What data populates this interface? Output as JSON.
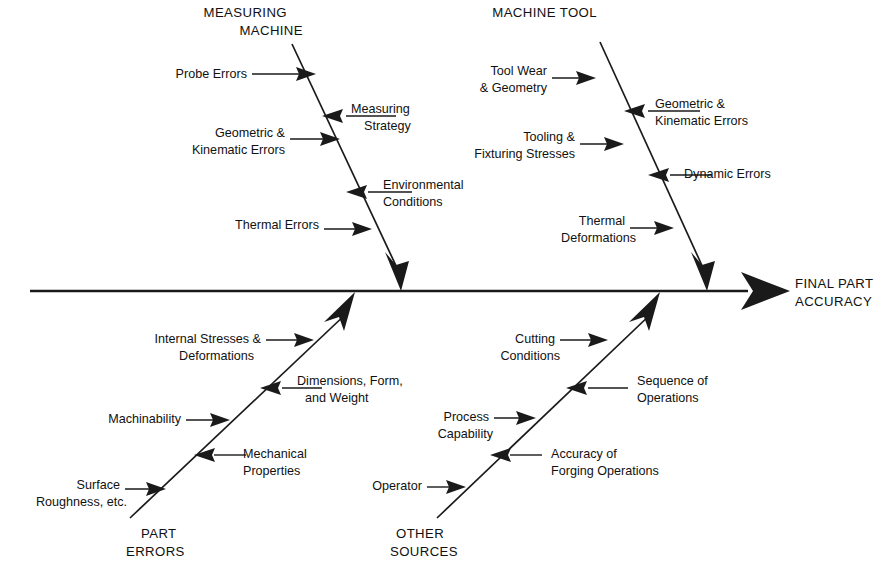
{
  "diagram": {
    "type": "fishbone-ishikawa-cause-and-effect",
    "effect": {
      "line1": "FINAL PART",
      "line2": "ACCURACY"
    },
    "categories": [
      {
        "id": "measuring-machine",
        "title_line1": "MEASURING",
        "title_line2": "MACHINE",
        "position": "top-left",
        "causes": [
          {
            "id": "probe-errors",
            "line1": "Probe Errors",
            "line2": "",
            "side": "left"
          },
          {
            "id": "measuring-strategy",
            "line1": "Measuring",
            "line2": "Strategy",
            "side": "right"
          },
          {
            "id": "geometric-kinematic-errors",
            "line1": "Geometric &",
            "line2": "Kinematic Errors",
            "side": "left"
          },
          {
            "id": "environmental-conditions",
            "line1": "Environmental",
            "line2": "Conditions",
            "side": "right"
          },
          {
            "id": "thermal-errors",
            "line1": "Thermal Errors",
            "line2": "",
            "side": "left"
          }
        ]
      },
      {
        "id": "machine-tool",
        "title_line1": "MACHINE TOOL",
        "title_line2": "",
        "position": "top-right",
        "causes": [
          {
            "id": "tool-wear-geometry",
            "line1": "Tool Wear",
            "line2": "& Geometry",
            "side": "left"
          },
          {
            "id": "geometric-kinematic-errors-mt",
            "line1": "Geometric &",
            "line2": "Kinematic Errors",
            "side": "right"
          },
          {
            "id": "tooling-fixturing-stresses",
            "line1": "Tooling &",
            "line2": "Fixturing Stresses",
            "side": "left"
          },
          {
            "id": "dynamic-errors",
            "line1": "Dynamic Errors",
            "line2": "",
            "side": "right"
          },
          {
            "id": "thermal-deformations",
            "line1": "Thermal",
            "line2": "Deformations",
            "side": "left"
          }
        ]
      },
      {
        "id": "part-errors",
        "title_line1": "PART",
        "title_line2": "ERRORS",
        "position": "bottom-left",
        "causes": [
          {
            "id": "internal-stresses-deformations",
            "line1": "Internal Stresses &",
            "line2": "Deformations",
            "side": "left"
          },
          {
            "id": "dimensions-form-weight",
            "line1": "Dimensions, Form,",
            "line2": "and Weight",
            "side": "right"
          },
          {
            "id": "machinability",
            "line1": "Machinability",
            "line2": "",
            "side": "left"
          },
          {
            "id": "mechanical-properties",
            "line1": "Mechanical",
            "line2": "Properties",
            "side": "right"
          },
          {
            "id": "surface-roughness",
            "line1": "Surface",
            "line2": "Roughness, etc.",
            "side": "left"
          }
        ]
      },
      {
        "id": "other-sources",
        "title_line1": "OTHER",
        "title_line2": "SOURCES",
        "position": "bottom-right",
        "causes": [
          {
            "id": "cutting-conditions",
            "line1": "Cutting",
            "line2": "Conditions",
            "side": "left"
          },
          {
            "id": "sequence-of-operations",
            "line1": "Sequence of",
            "line2": "Operations",
            "side": "right"
          },
          {
            "id": "process-capability",
            "line1": "Process",
            "line2": "Capability",
            "side": "left"
          },
          {
            "id": "accuracy-of-forging",
            "line1": "Accuracy of",
            "line2": "Forging Operations",
            "side": "right"
          },
          {
            "id": "operator",
            "line1": "Operator",
            "line2": "",
            "side": "left"
          }
        ]
      }
    ],
    "colors": {
      "ink": "#1a1a1a",
      "text": "#111111",
      "background": "#ffffff"
    }
  }
}
